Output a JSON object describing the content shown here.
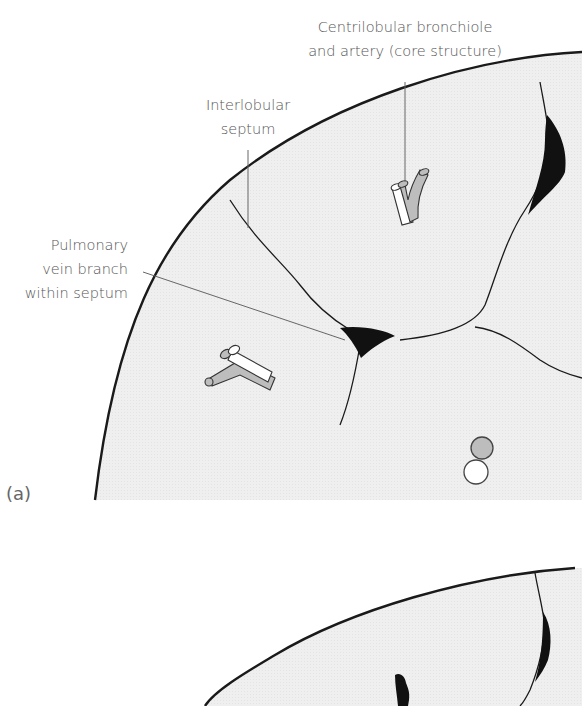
{
  "figure": {
    "panels": [
      {
        "id": "a",
        "label": "(a)",
        "annotations": [
          {
            "id": "core",
            "lines": [
              "Centrilobular bronchiole",
              "and artery (core structure)"
            ]
          },
          {
            "id": "septum",
            "lines": [
              "Interlobular",
              "septum"
            ]
          },
          {
            "id": "vein",
            "lines": [
              "Pulmonary",
              "vein branch",
              "within septum"
            ]
          }
        ]
      },
      {
        "id": "b",
        "label": ""
      }
    ],
    "colors": {
      "background": "#ffffff",
      "lobule_fill": "#efefef",
      "outline": "#1a1a1a",
      "vein": "#111111",
      "airway_fill": "#bdbdbd",
      "airway_wall": "#ffffff",
      "leader": "#666666"
    }
  }
}
